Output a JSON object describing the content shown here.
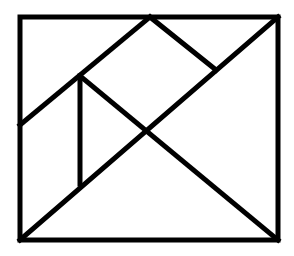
{
  "figure": {
    "title": "Tangram square dissection",
    "background": "#ffffff",
    "stroke_color": "#000000",
    "outer_frame": {
      "x1": 20,
      "y1": 17,
      "x2": 278,
      "y2": 240
    },
    "segments": [
      {
        "name": "upper-left-diagonal",
        "x1": 20,
        "y1": 125,
        "x2": 150,
        "y2": 17
      },
      {
        "name": "main-diagonal",
        "x1": 20,
        "y1": 240,
        "x2": 278,
        "y2": 17
      },
      {
        "name": "top-right-slant",
        "x1": 150,
        "y1": 17,
        "x2": 216,
        "y2": 70
      },
      {
        "name": "cross-diagonal",
        "x1": 80,
        "y1": 76,
        "x2": 278,
        "y2": 240
      },
      {
        "name": "vertical-divider",
        "x1": 80,
        "y1": 76,
        "x2": 80,
        "y2": 184
      }
    ]
  }
}
